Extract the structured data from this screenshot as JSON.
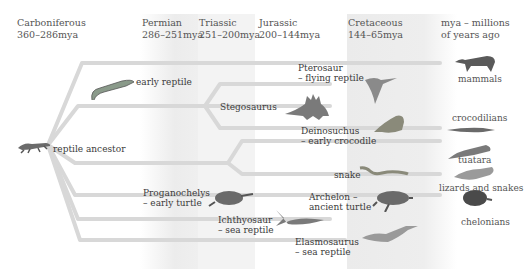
{
  "periods": [
    {
      "name": "Carboniferous",
      "range": "360–286mya"
    },
    {
      "name": "Permian",
      "range": "286–251mya"
    },
    {
      "name": "Triassic",
      "range": "251–200mya"
    },
    {
      "name": "Jurassic",
      "range": "200–144mya"
    },
    {
      "name": "Cretaceous",
      "range": "144–65mya"
    }
  ],
  "legend": {
    "line1": "mya – millions",
    "line2": "of years ago"
  },
  "colors": {
    "line": "#d6d6d6",
    "band_shade": "#ececec",
    "text": "#3a3a3a"
  },
  "ancestors": {
    "root": "reptile ancestor",
    "early_reptile": "early reptile",
    "stegosaurus": "Stegosaurus",
    "pterosaur": {
      "line1": "Pterosaur",
      "line2": "– flying reptile"
    },
    "deinosuchus": {
      "line1": "Deinosuchus",
      "line2": "– early crocodile"
    },
    "snake": "snake",
    "proganochelys": {
      "line1": "Proganochelys",
      "line2": "– early turtle"
    },
    "archelon": {
      "line1": "Archelon –",
      "line2": "ancient turtle"
    },
    "ichthyosaur": {
      "line1": "Ichthyosaur",
      "line2": "– sea reptile"
    },
    "elasmosaurus": {
      "line1": "Elasmosaurus",
      "line2": "– sea reptile"
    }
  },
  "modern": {
    "mammals": "mammals",
    "crocodilians": "crocodilians",
    "tuatara": "tuatara",
    "lizards_snakes": "lizards and snakes",
    "chelonians": "chelonians"
  }
}
